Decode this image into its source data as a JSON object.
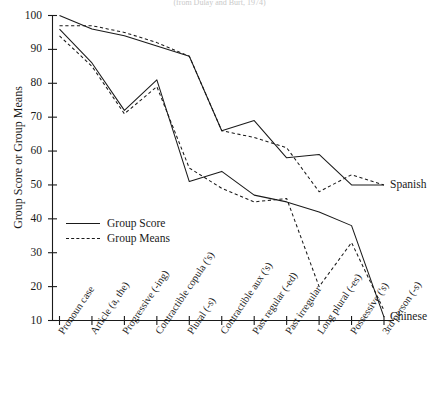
{
  "chart_data": {
    "type": "line",
    "title": "(from Dulay and Burt, 1974)",
    "xlabel": "",
    "ylabel": "Group Score or Group Means",
    "ylim": [
      10,
      100
    ],
    "yticks": [
      10,
      20,
      30,
      40,
      50,
      60,
      70,
      80,
      90,
      100
    ],
    "grid": false,
    "legend_position": "inner-left",
    "legend": [
      {
        "label": "Group Score",
        "style": "solid"
      },
      {
        "label": "Group Means",
        "style": "dashed"
      }
    ],
    "categories": [
      "Pronoun case",
      "Article (a, the)",
      "Progressive (-ing)",
      "Contractible copula ('s)",
      "Plural (-s)",
      "Contractible aux ('s)",
      "Past regular (-ed)",
      "Past irregular",
      "Long plural (-es)",
      "Possessive ('s)",
      "3rd person (-s)"
    ],
    "series": [
      {
        "name": "Spanish Group Score",
        "group": "Spanish",
        "style": "solid",
        "values": [
          100,
          96,
          94,
          91,
          88,
          66,
          69,
          58,
          59,
          50,
          50
        ]
      },
      {
        "name": "Spanish Group Means",
        "group": "Spanish",
        "style": "dashed",
        "values": [
          97,
          97,
          95,
          92,
          88,
          66,
          64,
          61,
          48,
          53,
          50
        ]
      },
      {
        "name": "Chinese Group Score",
        "group": "Chinese",
        "style": "solid",
        "values": [
          96,
          86,
          72,
          81,
          51,
          54,
          47,
          45,
          42,
          38,
          11
        ]
      },
      {
        "name": "Chinese Group Means",
        "group": "Chinese",
        "style": "dashed",
        "values": [
          94,
          85,
          71,
          79,
          55,
          49,
          45,
          46,
          20,
          33,
          13
        ]
      }
    ],
    "series_tags": [
      {
        "label": "Spanish",
        "at_category": "3rd person (-s)",
        "value": 50
      },
      {
        "label": "Chinese",
        "at_category": "3rd person (-s)",
        "value": 11
      }
    ]
  }
}
